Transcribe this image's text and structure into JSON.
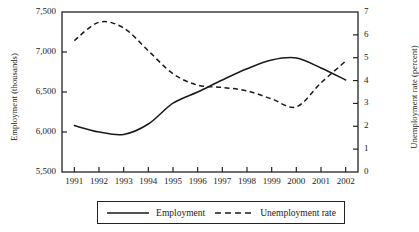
{
  "chart_data": {
    "type": "line",
    "title": "",
    "subtitle": "",
    "xlabel": "",
    "ylabel": "Employment (thousands)",
    "y2label": "Unemployment rate (percent)",
    "grid": false,
    "legend_position": "bottom",
    "categories": [
      "1991",
      "1992",
      "1993",
      "1994",
      "1995",
      "1996",
      "1997",
      "1998",
      "1999",
      "2000",
      "2001",
      "2002"
    ],
    "x": [
      1991,
      1992,
      1993,
      1994,
      1995,
      1996,
      1997,
      1998,
      1999,
      2000,
      2001,
      2002
    ],
    "ylim": [
      5500,
      7500
    ],
    "yticks": [
      "5,500",
      "6,000",
      "6,500",
      "7,000",
      "7,500"
    ],
    "ytick_values": [
      5500,
      6000,
      6500,
      7000,
      7500
    ],
    "y2lim": [
      0,
      7
    ],
    "y2ticks": [
      "0",
      "1",
      "2",
      "3",
      "4",
      "5",
      "6",
      "7"
    ],
    "y2tick_values": [
      0,
      1,
      2,
      3,
      4,
      5,
      6,
      7
    ],
    "series": [
      {
        "name": "Employment",
        "axis": "left",
        "style": "solid",
        "color": "#1a1a1a",
        "values": [
          6080,
          6000,
          5970,
          6100,
          6360,
          6500,
          6650,
          6790,
          6900,
          6925,
          6800,
          6650
        ]
      },
      {
        "name": "Unemployment rate",
        "axis": "right",
        "style": "dashed",
        "color": "#1a1a1a",
        "values": [
          5.75,
          6.55,
          6.3,
          5.3,
          4.3,
          3.8,
          3.7,
          3.55,
          3.2,
          2.85,
          3.9,
          4.85
        ]
      }
    ]
  },
  "legend": {
    "items": [
      {
        "label": "Employment",
        "style": "solid"
      },
      {
        "label": "Unemployment rate",
        "style": "dashed"
      }
    ]
  }
}
